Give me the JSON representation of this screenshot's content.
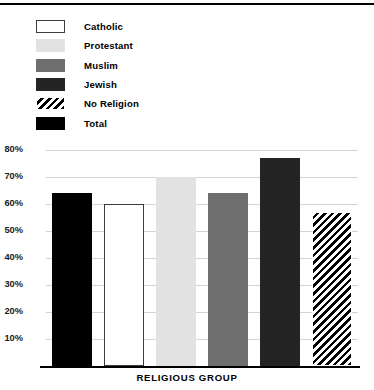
{
  "legend": {
    "items": [
      {
        "label": "Catholic",
        "swatch": "catholic-swatch",
        "color": "#ffffff"
      },
      {
        "label": "Protestant",
        "swatch": "protestant-swatch",
        "color": "#e2e2e2"
      },
      {
        "label": "Muslim",
        "swatch": "muslim-swatch",
        "color": "#6e6e6e"
      },
      {
        "label": "Jewish",
        "swatch": "jewish-swatch",
        "color": "#242424"
      },
      {
        "label": "No Religion",
        "swatch": "no-religion-swatch",
        "color": "#000000"
      },
      {
        "label": "Total",
        "swatch": "total-swatch",
        "color": "#000000"
      }
    ]
  },
  "yaxis": {
    "ticks": [
      "80%",
      "70%",
      "60%",
      "50%",
      "40%",
      "30%",
      "20%",
      "10%"
    ]
  },
  "chart_data": {
    "type": "bar",
    "title": "",
    "xlabel": "RELIGIOUS GROUP",
    "ylabel": "",
    "categories": [
      "Total",
      "Catholic",
      "Protestant",
      "Muslim",
      "Jewish",
      "No Religion"
    ],
    "values": [
      64,
      60,
      70,
      64,
      77,
      57
    ],
    "value_labels": [
      "64%",
      "60%",
      "70%",
      "64%",
      "77%",
      "57%"
    ],
    "ylim": [
      0,
      85
    ],
    "ytick_values": [
      80,
      70,
      60,
      50,
      40,
      30,
      20,
      10
    ],
    "ytick_labels": [
      "80%",
      "70%",
      "60%",
      "50%",
      "40%",
      "30%",
      "20%",
      "10%"
    ],
    "grid": true,
    "legend_position": "top-left",
    "bar_styles": [
      "solid-black",
      "white-outlined",
      "light-gray",
      "medium-gray",
      "dark-gray",
      "diagonal-hatch"
    ],
    "colors": [
      "#000000",
      "#ffffff",
      "#e2e2e2",
      "#6e6e6e",
      "#242424",
      "#000000"
    ]
  }
}
